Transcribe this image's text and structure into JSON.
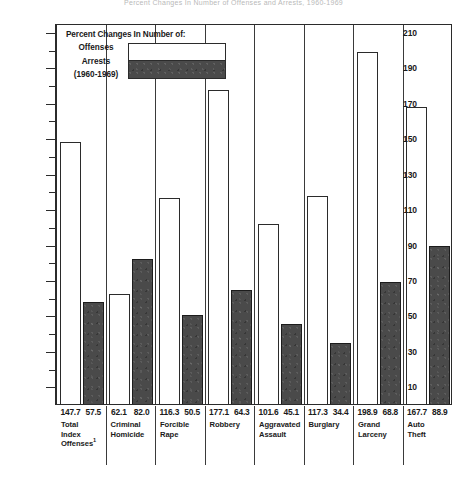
{
  "title": "Percent Changes In Number of Offenses and Arrests, 1960-1969",
  "legend": {
    "title": "Percent Changes In Number of:",
    "labels": [
      "Offenses",
      "Arrests",
      "(1960-1969)"
    ],
    "swatch_offenses_name": "offenses-swatch",
    "swatch_arrests_name": "arrests-swatch",
    "color_offenses": "#ffffff",
    "color_arrests": "#4a4a4a"
  },
  "yaxis": {
    "ticks_major": [
      210,
      190,
      170,
      150,
      130,
      110,
      90,
      70,
      50,
      30,
      10
    ],
    "ticks_minor": [
      200,
      180,
      160,
      140,
      120,
      100,
      80,
      60,
      40,
      20
    ],
    "min": 0,
    "max": 215
  },
  "footnote_marker": "1",
  "chart_data": {
    "type": "bar",
    "title": "Percent Changes In Number of Offenses and Arrests, 1960-1969",
    "xlabel": "",
    "ylabel": "",
    "ylim": [
      0,
      215
    ],
    "grid": false,
    "legend_position": "inside-top-left",
    "categories": [
      "Total Index Offenses",
      "Criminal Homicide",
      "Forcible Rape",
      "Robbery",
      "Aggravated Assault",
      "Burglary",
      "Grand Larceny",
      "Auto Theft"
    ],
    "category_lines": [
      [
        "Total",
        "Index",
        "Offenses"
      ],
      [
        "Criminal",
        "Homicide"
      ],
      [
        "Forcible",
        "Rape"
      ],
      [
        "Robbery"
      ],
      [
        "Aggravated",
        "Assault"
      ],
      [
        "Burglary"
      ],
      [
        "Grand",
        "Larceny"
      ],
      [
        "Auto",
        "Theft"
      ]
    ],
    "series": [
      {
        "name": "Offenses",
        "color": "#ffffff",
        "values": [
          147.7,
          62.1,
          116.3,
          177.1,
          101.6,
          117.3,
          198.9,
          167.7
        ]
      },
      {
        "name": "Arrests",
        "color": "#4a4a4a",
        "values": [
          57.5,
          82.0,
          50.5,
          64.3,
          45.1,
          34.4,
          68.8,
          88.9
        ]
      }
    ]
  }
}
